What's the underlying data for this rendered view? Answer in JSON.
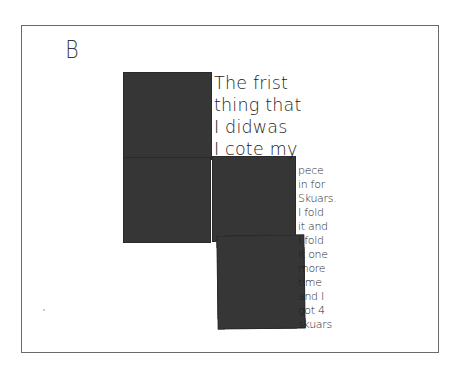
{
  "document": {
    "label": "B",
    "handwriting_top": [
      "The frist",
      "thing that",
      "I didwas",
      "I cote my"
    ],
    "handwriting_side": [
      "pece",
      "in for",
      "Skuars.",
      "I fold",
      "it and",
      "I fold",
      "It one",
      "more",
      "time",
      "and I",
      "got 4",
      "skuars"
    ],
    "squares": [
      {
        "name": "square-top-left",
        "color": "#363636"
      },
      {
        "name": "square-middle-left",
        "color": "#363636"
      },
      {
        "name": "square-middle-right",
        "color": "#363636"
      },
      {
        "name": "square-bottom-right",
        "color": "#363636"
      }
    ],
    "colors": {
      "paper": "#ffffff",
      "frame_border": "#6a6a6a",
      "ink": "#1e1e1e",
      "paper_squares": "#363636"
    }
  }
}
